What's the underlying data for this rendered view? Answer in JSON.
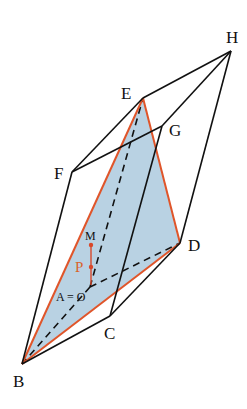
{
  "diagram": {
    "type": "3D parallelepiped with shaded cross-section triangle",
    "colors": {
      "edge": "#111111",
      "triangle_edge": "#e0552a",
      "triangle_fill": "#b9d2e3",
      "segment_MP": "#d9482a",
      "label_P": "#d9632b"
    },
    "vertices": {
      "A": {
        "label": "A = O",
        "x": 90,
        "y": 287
      },
      "B": {
        "label": "B",
        "x": 22,
        "y": 364
      },
      "C": {
        "label": "C",
        "x": 110,
        "y": 316
      },
      "D": {
        "label": "D",
        "x": 180,
        "y": 243
      },
      "E": {
        "label": "E",
        "x": 143,
        "y": 98
      },
      "F": {
        "label": "F",
        "x": 72,
        "y": 172
      },
      "G": {
        "label": "G",
        "x": 162,
        "y": 126
      },
      "H": {
        "label": "H",
        "x": 231,
        "y": 51
      }
    },
    "points": {
      "M": {
        "label": "M",
        "x": 91,
        "y": 245
      },
      "P": {
        "label": "P",
        "x": 91,
        "y": 267
      }
    },
    "solid_edges": [
      [
        "B",
        "C"
      ],
      [
        "C",
        "D"
      ],
      [
        "B",
        "F"
      ],
      [
        "F",
        "E"
      ],
      [
        "F",
        "G"
      ],
      [
        "E",
        "H"
      ],
      [
        "G",
        "H"
      ],
      [
        "D",
        "H"
      ],
      [
        "C",
        "G"
      ]
    ],
    "dashed_edges": [
      [
        "A",
        "B"
      ],
      [
        "A",
        "D"
      ],
      [
        "A",
        "E"
      ]
    ],
    "shaded_triangle": [
      "B",
      "D",
      "E"
    ]
  },
  "labels": {
    "A": "A = O",
    "B": "B",
    "C": "C",
    "D": "D",
    "E": "E",
    "F": "F",
    "G": "G",
    "H": "H",
    "M": "M",
    "P": "P"
  }
}
